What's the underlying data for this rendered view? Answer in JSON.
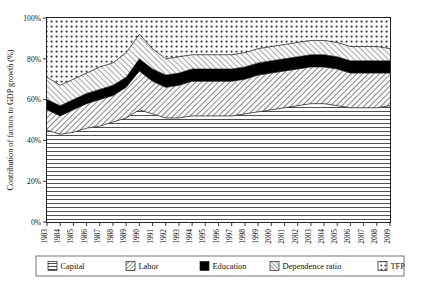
{
  "chart_data": {
    "type": "area",
    "stacked": true,
    "title": "",
    "xlabel": "",
    "ylabel": "Contribution of factors to GDP growth (%)",
    "ylim": [
      0,
      100
    ],
    "ytick_labels": [
      "0%",
      "20%",
      "40%",
      "60%",
      "80%",
      "100%"
    ],
    "ytick_values": [
      0,
      20,
      40,
      60,
      80,
      100
    ],
    "grid": false,
    "legend_position": "bottom",
    "categories": [
      "1983",
      "1984",
      "1985",
      "1986",
      "1987",
      "1988",
      "1989",
      "1990",
      "1991",
      "1992",
      "1993",
      "1994",
      "1995",
      "1996",
      "1997",
      "1998",
      "1999",
      "2000",
      "2001",
      "2002",
      "2003",
      "2004",
      "2005",
      "2006",
      "2007",
      "2008",
      "2009"
    ],
    "series": [
      {
        "name": "Capital",
        "pattern": "horizontal-lines",
        "color": "#ffffff",
        "values": [
          45,
          43,
          44,
          46,
          47,
          49,
          51,
          55,
          53,
          51,
          51,
          52,
          52,
          52,
          52,
          53,
          54,
          55,
          56,
          57,
          58,
          58,
          57,
          56,
          56,
          56,
          57
        ]
      },
      {
        "name": "Labor",
        "pattern": "diagonal-hatch-right",
        "color": "#e9e9e9",
        "values": [
          10,
          9,
          11,
          12,
          13,
          13,
          15,
          19,
          16,
          15,
          16,
          17,
          17,
          17,
          17,
          17,
          18,
          18,
          18,
          18,
          18,
          18,
          18,
          17,
          17,
          17,
          16
        ]
      },
      {
        "name": "Education",
        "pattern": "solid-black",
        "color": "#000000",
        "values": [
          5,
          5,
          5,
          5,
          5,
          5,
          5,
          6,
          6,
          6,
          6,
          6,
          6,
          6,
          6,
          6,
          6,
          6,
          6,
          6,
          6,
          6,
          6,
          6,
          6,
          6,
          6
        ]
      },
      {
        "name": "Dependence ratio",
        "pattern": "diagonal-hatch-left",
        "color": "#f2f2f2",
        "values": [
          11,
          10,
          10,
          10,
          11,
          11,
          12,
          12,
          10,
          8,
          8,
          7,
          7,
          7,
          7,
          7,
          7,
          7,
          7,
          7,
          7,
          7,
          7,
          7,
          7,
          7,
          6
        ]
      },
      {
        "name": "TFP",
        "pattern": "dotted",
        "color": "#ffffff",
        "values": [
          29,
          33,
          30,
          27,
          24,
          22,
          17,
          8,
          15,
          20,
          19,
          18,
          18,
          18,
          18,
          17,
          15,
          14,
          13,
          12,
          11,
          11,
          12,
          14,
          14,
          14,
          15
        ]
      }
    ],
    "cumulative_tops": {
      "capital": [
        45,
        43,
        44,
        46,
        47,
        49,
        51,
        55,
        53,
        51,
        51,
        52,
        52,
        52,
        52,
        53,
        54,
        55,
        56,
        57,
        58,
        58,
        57,
        56,
        56,
        56,
        57
      ],
      "labor": [
        55,
        52,
        55,
        58,
        60,
        62,
        66,
        74,
        69,
        66,
        67,
        69,
        69,
        69,
        69,
        70,
        72,
        73,
        74,
        75,
        76,
        76,
        75,
        73,
        73,
        73,
        73
      ],
      "education": [
        59,
        56,
        59,
        62,
        65,
        67,
        71,
        80,
        75,
        72,
        73,
        75,
        75,
        75,
        75,
        76,
        78,
        79,
        80,
        81,
        82,
        82,
        81,
        79,
        79,
        79,
        79
      ],
      "dependence_ratio": [
        70,
        66,
        69,
        72,
        76,
        78,
        83,
        92,
        85,
        80,
        81,
        82,
        82,
        82,
        82,
        83,
        85,
        86,
        87,
        88,
        89,
        89,
        88,
        86,
        86,
        86,
        85
      ],
      "tfp": [
        100,
        100,
        100,
        100,
        100,
        100,
        100,
        100,
        100,
        100,
        100,
        100,
        100,
        100,
        100,
        100,
        100,
        100,
        100,
        100,
        100,
        100,
        100,
        100,
        100,
        100,
        100
      ]
    }
  },
  "legend": {
    "items": [
      {
        "label": "Capital",
        "pattern": "horizontal-lines"
      },
      {
        "label": "Labor",
        "pattern": "diagonal-hatch-right"
      },
      {
        "label": "Education",
        "pattern": "solid-black"
      },
      {
        "label": "Dependence ratio",
        "pattern": "diagonal-hatch-left"
      },
      {
        "label": "TFP",
        "pattern": "dotted"
      }
    ]
  }
}
